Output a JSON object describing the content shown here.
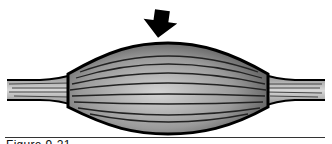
{
  "figure": {
    "arrow": {
      "direction": "down",
      "color": "#000000"
    },
    "colors": {
      "outline": "#000000",
      "belly_light": "#c8c8c8",
      "belly_dark": "#5a5a5a",
      "tendon": "#b0b0b0"
    }
  },
  "caption": {
    "label": "Figure 9-21"
  }
}
